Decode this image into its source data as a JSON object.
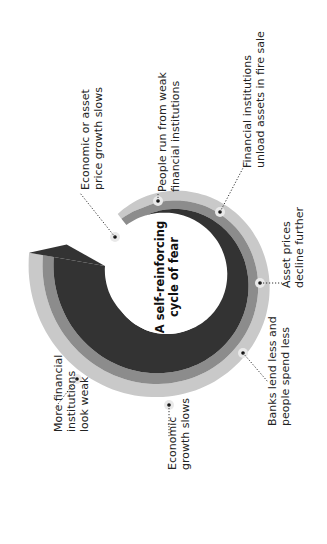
{
  "diagram": {
    "title_lines": [
      "A self-reinforcing",
      "cycle of fear"
    ],
    "orientation": "rotated -90deg (text reads bottom to top)",
    "colors": {
      "outer_band": "#c9c9c9",
      "middle_band": "#8c8c8c",
      "inner_band": "#333333",
      "center": "#ffffff",
      "text": "#222222"
    },
    "steps": [
      {
        "id": "step-1",
        "lines": [
          "Economic or asset",
          "price growth slows"
        ]
      },
      {
        "id": "step-2",
        "lines": [
          "People run from weak",
          "financial institutions"
        ]
      },
      {
        "id": "step-3",
        "lines": [
          "Financial institutions",
          "unload assets in fire sale"
        ]
      },
      {
        "id": "step-4",
        "lines": [
          "Asset prices",
          "decline further"
        ]
      },
      {
        "id": "step-5",
        "lines": [
          "Banks lend less and",
          "people spend less"
        ]
      },
      {
        "id": "step-6",
        "lines": [
          "Economic",
          "growth slows"
        ]
      },
      {
        "id": "step-7",
        "lines": [
          "More financial",
          "institutions",
          "look weak"
        ]
      }
    ]
  }
}
